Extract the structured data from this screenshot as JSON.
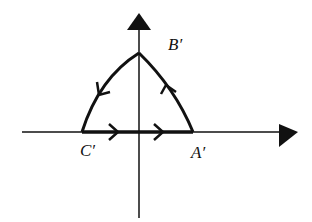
{
  "diagram": {
    "type": "contour-in-complex-plane",
    "colors": {
      "stroke": "#111111",
      "background": "#ffffff"
    },
    "axes": {
      "horizontal": {
        "direction": "right",
        "has_arrow": true
      },
      "vertical": {
        "direction": "up",
        "has_arrow": true
      }
    },
    "points": [
      {
        "id": "A",
        "label": "A′",
        "position": "on positive real axis"
      },
      {
        "id": "B",
        "label": "B′",
        "position": "on positive imaginary axis"
      },
      {
        "id": "C",
        "label": "C′",
        "position": "on negative real axis"
      }
    ],
    "edges": [
      {
        "from": "C′",
        "to": "A′",
        "shape": "straight",
        "orientation": "rightward",
        "arrows": 2
      },
      {
        "from": "A′",
        "to": "B′",
        "shape": "arc",
        "orientation": "upward",
        "arrows": 1
      },
      {
        "from": "B′",
        "to": "C′",
        "shape": "arc",
        "orientation": "downward-left",
        "arrows": 1
      }
    ]
  },
  "labels": {
    "A": "A′",
    "B": "B′",
    "C": "C′"
  }
}
